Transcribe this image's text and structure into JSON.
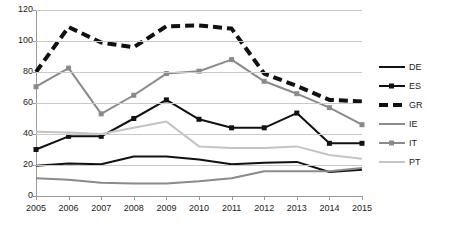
{
  "chart_data": {
    "type": "line",
    "title": "",
    "subtitle": "",
    "xlabel": "",
    "ylabel": "",
    "categories": [
      2005,
      2006,
      2007,
      2008,
      2009,
      2010,
      2011,
      2012,
      2013,
      2014,
      2015
    ],
    "xticklabels": [
      "2005",
      "2006",
      "2007",
      "2008",
      "2009",
      "2010",
      "2011",
      "2012",
      "2013",
      "2014",
      "2015"
    ],
    "yticklabels": [
      "0",
      "20",
      "40",
      "60",
      "80",
      "100",
      "120"
    ],
    "yticks": [
      0,
      20,
      40,
      60,
      80,
      100,
      120
    ],
    "ylim": [
      0,
      120
    ],
    "xlim": [
      2005,
      2015
    ],
    "grid": "horizontal",
    "legend_position": "right",
    "series": [
      {
        "name": "DE",
        "color": "#111111",
        "style": "solid",
        "marker": "none",
        "width": 2,
        "values": [
          19.5,
          21.0,
          20.5,
          25.5,
          25.5,
          23.5,
          20.5,
          21.5,
          22.0,
          15.5,
          17.0
        ]
      },
      {
        "name": "ES",
        "color": "#111111",
        "style": "solid",
        "marker": "square",
        "width": 2,
        "values": [
          30.0,
          38.5,
          38.5,
          50.0,
          62.0,
          49.5,
          44.0,
          44.0,
          53.5,
          34.0,
          34.0
        ]
      },
      {
        "name": "GR",
        "color": "#111111",
        "style": "dashed",
        "marker": "none",
        "width": 4,
        "values": [
          80.0,
          109.0,
          99.0,
          96.0,
          109.5,
          110.0,
          108.0,
          79.0,
          71.0,
          62.0,
          61.0
        ]
      },
      {
        "name": "IE",
        "color": "#8a8a8a",
        "style": "solid",
        "marker": "none",
        "width": 2,
        "values": [
          11.5,
          10.5,
          8.5,
          8.0,
          8.0,
          9.5,
          11.5,
          16.0,
          16.0,
          16.0,
          18.0
        ]
      },
      {
        "name": "IT",
        "color": "#8a8a8a",
        "style": "solid",
        "marker": "square",
        "width": 2,
        "values": [
          70.5,
          82.5,
          53.0,
          65.0,
          79.0,
          80.5,
          88.0,
          74.0,
          66.0,
          57.0,
          46.0
        ]
      },
      {
        "name": "PT",
        "color": "#c4c4c4",
        "style": "solid",
        "marker": "none",
        "width": 2,
        "values": [
          41.5,
          41.0,
          40.0,
          44.0,
          48.0,
          32.0,
          31.0,
          31.0,
          32.0,
          26.5,
          24.0
        ]
      }
    ]
  },
  "legend": {
    "items": [
      {
        "label": "DE"
      },
      {
        "label": "ES"
      },
      {
        "label": "GR"
      },
      {
        "label": "IE"
      },
      {
        "label": "IT"
      },
      {
        "label": "PT"
      }
    ]
  }
}
